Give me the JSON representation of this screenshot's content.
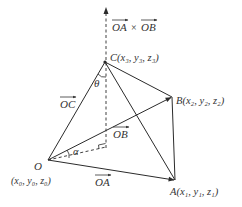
{
  "diagram": {
    "type": "vector-geometry",
    "stroke_color": "#2b2b2b",
    "background": "#ffffff",
    "points": {
      "O": {
        "name": "O",
        "coords": "(x₀, y₀, z₀)",
        "x": 48,
        "y": 160
      },
      "A": {
        "name": "A",
        "coords": "(x₁, y₁, z₁)",
        "x": 175,
        "y": 180
      },
      "B": {
        "name": "B",
        "coords": "(x₂, y₂, z₂)",
        "x": 172,
        "y": 97
      },
      "C": {
        "name": "C",
        "coords": "(x₃, y₃, z₃)",
        "x": 105,
        "y": 62
      }
    },
    "labels": {
      "O": "O",
      "O_coords": "(x₀, y₀, z₀)",
      "A_full": "A(x₁, y₁, z₁)",
      "B_full": "B(x₂, y₂, z₂)",
      "C_full": "C(x₃, y₃, z₃)",
      "vec_OA": "OA",
      "vec_OB": "OB",
      "vec_OC": "OC",
      "cross_OA": "OA",
      "cross_times": "×",
      "cross_OB": "OB",
      "theta": "θ",
      "alpha": "α"
    },
    "edges": [
      {
        "from": "O",
        "to": "A",
        "style": "arrow"
      },
      {
        "from": "O",
        "to": "B",
        "style": "arrow"
      },
      {
        "from": "O",
        "to": "C",
        "style": "solid"
      },
      {
        "from": "C",
        "to": "A",
        "style": "solid"
      },
      {
        "from": "C",
        "to": "B",
        "style": "solid"
      },
      {
        "from": "B",
        "to": "A",
        "style": "solid"
      },
      {
        "from": "O",
        "to": "foot",
        "style": "dashed"
      },
      {
        "from": "foot",
        "to": "normal_tip",
        "style": "dashed-arrow"
      }
    ],
    "annotations": {
      "normal_vector": "OA × OB",
      "angle_theta": "angle between OC and normal",
      "angle_alpha": "angle between OC projection and OB",
      "right_angle_marker": true
    }
  }
}
